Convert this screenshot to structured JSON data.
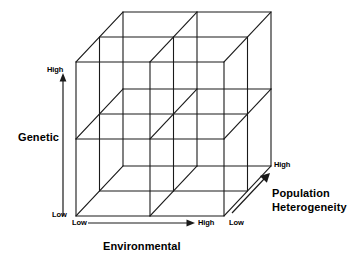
{
  "figure": {
    "type": "3d-cube-diagram",
    "background_color": "#ffffff",
    "line_color": "#1a1a1a"
  },
  "axes": {
    "vertical": {
      "name": "genetic",
      "title": "Genetic",
      "low_label": "Low",
      "high_label": "High",
      "direction": "up",
      "arrow": true
    },
    "horizontal": {
      "name": "environmental",
      "title": "Environmental",
      "low_label": "Low",
      "high_label": "High",
      "direction": "right",
      "arrow": true
    },
    "depth": {
      "name": "population-heterogeneity",
      "title_line1": "Population",
      "title_line2": "Heterogeneity",
      "low_label": "Low",
      "high_label": "High",
      "direction": "up-right",
      "arrow": true
    }
  },
  "cube": {
    "divisions": 2,
    "cells_total": 8,
    "front_face": {
      "left": 76,
      "right": 224,
      "top": 62,
      "bottom": 216
    },
    "depth_offset": {
      "dx": 47,
      "dy": -50
    }
  }
}
